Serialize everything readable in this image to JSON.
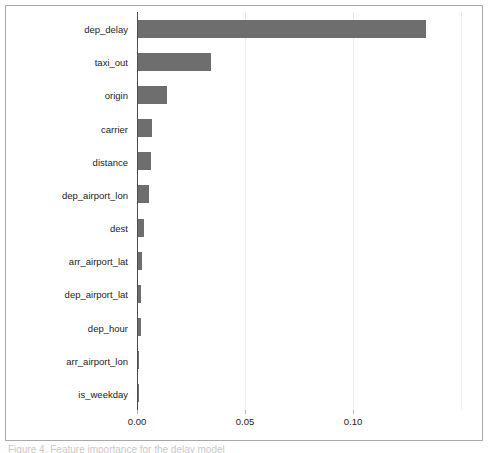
{
  "figure": {
    "caption_partial": "Figure 4.  Feature importance for the delay model"
  },
  "chart_data": {
    "type": "bar",
    "orientation": "horizontal",
    "title": "",
    "xlabel": "",
    "ylabel": "",
    "grid": true,
    "legend": null,
    "xlim": [
      0.0,
      0.1597
    ],
    "xticks": [
      0.0,
      0.05,
      0.1
    ],
    "xtick_labels": [
      "0.00",
      "0.05",
      "0.10"
    ],
    "bar_color": "#6e6e6e",
    "categories": [
      "dep_delay",
      "taxi_out",
      "origin",
      "carrier",
      "distance",
      "dep_airport_lon",
      "dest",
      "arr_airport_lat",
      "dep_airport_lat",
      "dep_hour",
      "arr_airport_lon",
      "is_weekday"
    ],
    "values": [
      0.1333,
      0.0338,
      0.0134,
      0.0065,
      0.006,
      0.0051,
      0.0028,
      0.0019,
      0.0016,
      0.0012,
      0.0005,
      0.0002
    ]
  }
}
